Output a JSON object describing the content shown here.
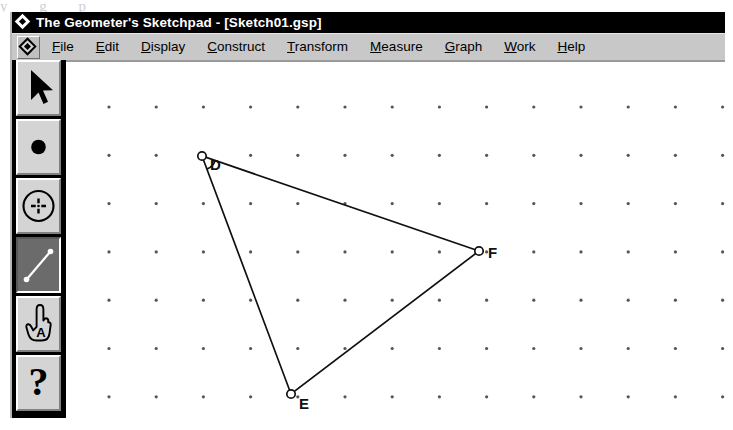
{
  "window": {
    "title": "The Geometer's Sketchpad - [Sketch01.gsp]",
    "app_icon": "diamond-icon"
  },
  "menubar": {
    "app_button_icon": "diamond-icon",
    "items": [
      {
        "label": "File",
        "accel": "F"
      },
      {
        "label": "Edit",
        "accel": "E"
      },
      {
        "label": "Display",
        "accel": "D"
      },
      {
        "label": "Construct",
        "accel": "C"
      },
      {
        "label": "Transform",
        "accel": "T"
      },
      {
        "label": "Measure",
        "accel": "M"
      },
      {
        "label": "Graph",
        "accel": "G"
      },
      {
        "label": "Work",
        "accel": "W"
      },
      {
        "label": "Help",
        "accel": "H"
      }
    ]
  },
  "toolbox": {
    "tools": [
      {
        "name": "selection-arrow-tool",
        "icon": "arrow-cursor-icon",
        "selected": false
      },
      {
        "name": "point-tool",
        "icon": "filled-dot-icon",
        "selected": false
      },
      {
        "name": "compass-circle-tool",
        "icon": "circle-crosshair-icon",
        "selected": false
      },
      {
        "name": "straightedge-segment-tool",
        "icon": "line-segment-icon",
        "selected": true
      },
      {
        "name": "text-tool",
        "icon": "hand-pointing-a-icon",
        "selected": false
      },
      {
        "name": "information-tool",
        "icon": "question-mark-icon",
        "selected": false
      }
    ]
  },
  "canvas": {
    "grid": {
      "origin_x": 43,
      "origin_y": 47,
      "step_x": 47.2,
      "step_y": 48.3,
      "cols": 14,
      "rows": 7,
      "dot_color": "#555555",
      "dot_radius": 1.6
    },
    "figure": {
      "type": "triangle",
      "stroke_color": "#101010",
      "stroke_width": 1.7,
      "vertices": [
        {
          "label": "D",
          "x": 136,
          "y": 96,
          "label_dx": 8,
          "label_dy": 14
        },
        {
          "label": "E",
          "x": 225,
          "y": 334,
          "label_dx": 8,
          "label_dy": 15
        },
        {
          "label": "F",
          "x": 413,
          "y": 191,
          "label_dx": 9,
          "label_dy": 7
        }
      ],
      "vertex_marker": {
        "radius": 4.2,
        "fill": "#ffffff",
        "stroke": "#101010",
        "stroke_width": 1.7
      },
      "angle_arc": {
        "at": "D",
        "radius": 14,
        "note": "small angle mark at vertex D"
      }
    }
  },
  "scan_artifact": {
    "top_bleed_text": "y g p"
  }
}
